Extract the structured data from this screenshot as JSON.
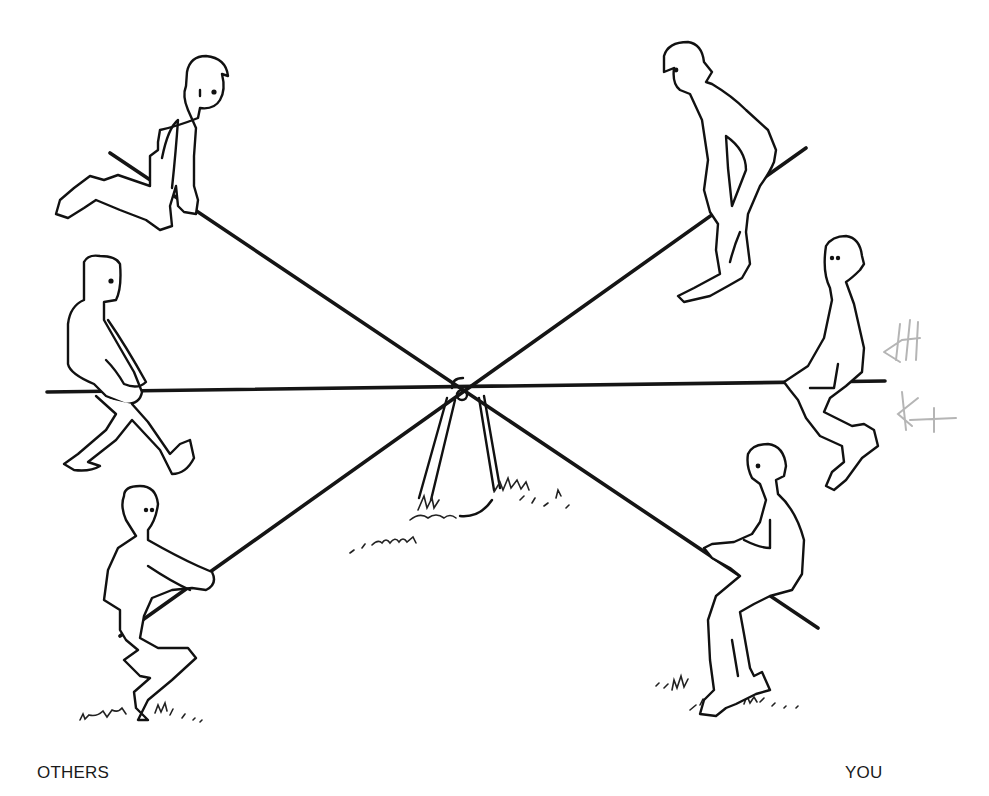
{
  "illustration": {
    "subject": "three-beam seesaw with six figures",
    "figure_count": 6,
    "beam_count": 3
  },
  "labels": {
    "left": "OTHERS",
    "right": "YOU"
  },
  "annotations": {
    "pencil_tally": "HH",
    "pencil_initials": "KT"
  },
  "colors": {
    "ink": "#111111",
    "background": "#ffffff",
    "pencil": "#b5b5b5"
  }
}
